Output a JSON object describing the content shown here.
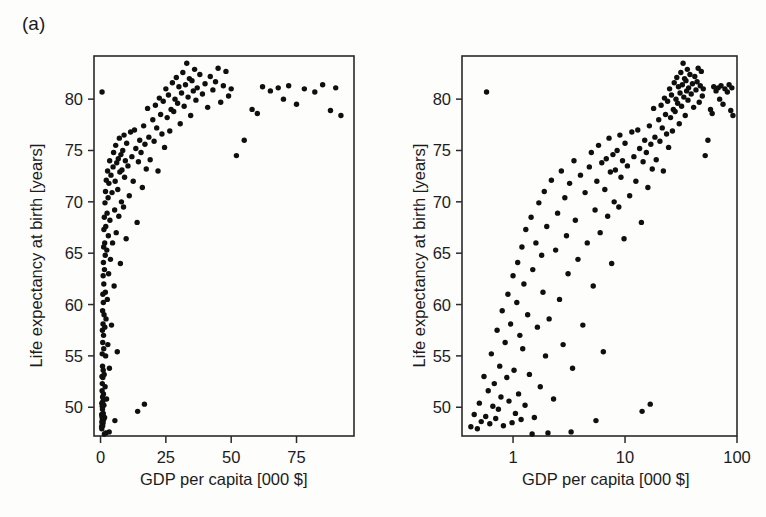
{
  "figure": {
    "panel_a_label": "(a)",
    "panel_b_label": "(b)",
    "y_axis_title": "Life expectancy at birth [years]",
    "x_axis_title": "GDP per capita [000 $]",
    "point_color": "#100f0f",
    "axis_color": "#2a2a2a",
    "background_color": "#fdfdfc"
  },
  "chart_data": [
    {
      "type": "scatter",
      "panel": "(a)",
      "title": "",
      "xlabel": "GDP per capita [000 $]",
      "ylabel": "Life expectancy at birth [years]",
      "xscale": "linear",
      "yscale": "linear",
      "xlim": [
        -2.5,
        97
      ],
      "ylim": [
        47.2,
        84.2
      ],
      "xticks": [
        0,
        25,
        50,
        75
      ],
      "xtick_labels": [
        "0",
        "25",
        "50",
        "75"
      ],
      "yticks": [
        50,
        55,
        60,
        65,
        70,
        75,
        80
      ],
      "ytick_labels": [
        "50",
        "55",
        "60",
        "65",
        "70",
        "75",
        "80"
      ],
      "grid": false,
      "legend": "none",
      "n_points": 181,
      "note": "Same data as panel (b); GDP on linear axis produces a sharply saturating curve."
    },
    {
      "type": "scatter",
      "panel": "(b)",
      "title": "",
      "xlabel": "GDP per capita [000 $]",
      "ylabel": "Life expectancy at birth [years]",
      "xscale": "log",
      "yscale": "linear",
      "xlim": [
        0.35,
        100
      ],
      "ylim": [
        47.2,
        84.2
      ],
      "xticks": [
        1,
        10,
        100
      ],
      "xtick_labels": [
        "1",
        "10",
        "100"
      ],
      "yticks": [
        50,
        55,
        60,
        65,
        70,
        75,
        80
      ],
      "ytick_labels": [
        "50",
        "55",
        "60",
        "65",
        "70",
        "75",
        "80"
      ],
      "grid": false,
      "legend": "none",
      "n_points": 181,
      "note": "Same data as panel (a); log GDP axis linearises the relationship."
    }
  ],
  "points": [
    [
      0.42,
      48.1
    ],
    [
      0.45,
      49.3
    ],
    [
      0.48,
      47.9
    ],
    [
      0.5,
      50.4
    ],
    [
      0.52,
      48.6
    ],
    [
      0.55,
      53.0
    ],
    [
      0.57,
      49.1
    ],
    [
      0.58,
      80.7
    ],
    [
      0.6,
      51.6
    ],
    [
      0.62,
      48.4
    ],
    [
      0.64,
      55.2
    ],
    [
      0.66,
      50.1
    ],
    [
      0.68,
      52.3
    ],
    [
      0.7,
      48.9
    ],
    [
      0.72,
      57.5
    ],
    [
      0.74,
      49.8
    ],
    [
      0.76,
      54.0
    ],
    [
      0.78,
      51.0
    ],
    [
      0.8,
      59.4
    ],
    [
      0.82,
      48.2
    ],
    [
      0.85,
      56.3
    ],
    [
      0.88,
      52.9
    ],
    [
      0.9,
      61.0
    ],
    [
      0.92,
      50.6
    ],
    [
      0.95,
      58.1
    ],
    [
      0.98,
      48.5
    ],
    [
      1.0,
      62.8
    ],
    [
      1.02,
      53.6
    ],
    [
      1.05,
      49.4
    ],
    [
      1.08,
      60.2
    ],
    [
      1.1,
      64.1
    ],
    [
      1.12,
      51.3
    ],
    [
      1.15,
      57.0
    ],
    [
      1.18,
      48.8
    ],
    [
      1.2,
      65.6
    ],
    [
      1.22,
      55.7
    ],
    [
      1.25,
      62.0
    ],
    [
      1.28,
      50.2
    ],
    [
      1.3,
      67.3
    ],
    [
      1.35,
      59.0
    ],
    [
      1.4,
      53.2
    ],
    [
      1.45,
      68.5
    ],
    [
      1.5,
      63.4
    ],
    [
      1.55,
      49.0
    ],
    [
      1.6,
      66.0
    ],
    [
      1.65,
      57.8
    ],
    [
      1.7,
      69.9
    ],
    [
      1.75,
      52.0
    ],
    [
      1.8,
      64.8
    ],
    [
      1.85,
      61.2
    ],
    [
      1.9,
      71.0
    ],
    [
      1.95,
      55.0
    ],
    [
      2.0,
      67.6
    ],
    [
      2.1,
      58.6
    ],
    [
      2.2,
      72.1
    ],
    [
      2.3,
      50.8
    ],
    [
      2.4,
      65.3
    ],
    [
      2.5,
      68.9
    ],
    [
      2.6,
      60.5
    ],
    [
      2.7,
      73.0
    ],
    [
      2.8,
      56.1
    ],
    [
      2.9,
      70.4
    ],
    [
      3.0,
      66.7
    ],
    [
      3.1,
      63.0
    ],
    [
      3.2,
      71.8
    ],
    [
      3.4,
      53.8
    ],
    [
      3.5,
      74.0
    ],
    [
      3.6,
      68.2
    ],
    [
      3.8,
      64.4
    ],
    [
      4.0,
      72.6
    ],
    [
      4.2,
      58.0
    ],
    [
      4.4,
      70.9
    ],
    [
      4.6,
      66.0
    ],
    [
      4.8,
      73.4
    ],
    [
      5.0,
      74.8
    ],
    [
      5.2,
      61.8
    ],
    [
      5.4,
      69.2
    ],
    [
      5.6,
      72.0
    ],
    [
      5.8,
      75.5
    ],
    [
      6.0,
      67.0
    ],
    [
      6.2,
      73.8
    ],
    [
      6.4,
      55.4
    ],
    [
      6.6,
      71.2
    ],
    [
      6.8,
      74.2
    ],
    [
      7.0,
      68.6
    ],
    [
      7.2,
      76.2
    ],
    [
      7.4,
      72.9
    ],
    [
      7.6,
      64.0
    ],
    [
      7.8,
      74.6
    ],
    [
      8.0,
      70.0
    ],
    [
      8.2,
      73.1
    ],
    [
      8.5,
      75.0
    ],
    [
      8.8,
      69.5
    ],
    [
      9.0,
      76.5
    ],
    [
      9.2,
      72.4
    ],
    [
      9.5,
      74.0
    ],
    [
      9.8,
      66.4
    ],
    [
      10.0,
      75.7
    ],
    [
      10.5,
      73.5
    ],
    [
      11.0,
      70.6
    ],
    [
      11.5,
      76.8
    ],
    [
      12.0,
      74.4
    ],
    [
      12.5,
      72.0
    ],
    [
      13.0,
      77.0
    ],
    [
      13.5,
      75.2
    ],
    [
      14.0,
      68.0
    ],
    [
      14.5,
      73.9
    ],
    [
      15.0,
      76.0
    ],
    [
      15.5,
      74.8
    ],
    [
      16.0,
      71.4
    ],
    [
      16.5,
      77.4
    ],
    [
      17.0,
      75.6
    ],
    [
      17.5,
      73.2
    ],
    [
      18.0,
      79.1
    ],
    [
      18.5,
      76.3
    ],
    [
      19.0,
      74.1
    ],
    [
      20.0,
      78.0
    ],
    [
      20.5,
      75.9
    ],
    [
      21.0,
      79.4
    ],
    [
      21.5,
      77.2
    ],
    [
      22.0,
      73.0
    ],
    [
      22.5,
      80.1
    ],
    [
      23.0,
      78.5
    ],
    [
      23.5,
      76.6
    ],
    [
      24.0,
      79.8
    ],
    [
      24.5,
      75.3
    ],
    [
      25.0,
      81.0
    ],
    [
      25.5,
      78.2
    ],
    [
      26.0,
      80.4
    ],
    [
      26.5,
      76.9
    ],
    [
      27.0,
      79.0
    ],
    [
      27.5,
      81.6
    ],
    [
      28.0,
      78.8
    ],
    [
      28.5,
      80.0
    ],
    [
      29.0,
      82.1
    ],
    [
      29.5,
      79.6
    ],
    [
      30.0,
      81.2
    ],
    [
      30.5,
      77.6
    ],
    [
      31.0,
      80.6
    ],
    [
      31.5,
      82.6
    ],
    [
      32.0,
      79.3
    ],
    [
      32.5,
      81.4
    ],
    [
      33.0,
      83.5
    ],
    [
      33.5,
      80.2
    ],
    [
      34.0,
      82.0
    ],
    [
      34.5,
      78.4
    ],
    [
      35.0,
      81.8
    ],
    [
      35.5,
      80.8
    ],
    [
      36.0,
      82.9
    ],
    [
      36.5,
      79.9
    ],
    [
      37.0,
      81.1
    ],
    [
      38.0,
      82.4
    ],
    [
      39.0,
      80.5
    ],
    [
      40.0,
      81.5
    ],
    [
      41.0,
      79.2
    ],
    [
      42.0,
      82.2
    ],
    [
      43.0,
      80.9
    ],
    [
      44.0,
      81.7
    ],
    [
      45.0,
      83.0
    ],
    [
      46.0,
      79.7
    ],
    [
      47.0,
      81.3
    ],
    [
      48.0,
      82.7
    ],
    [
      49.0,
      80.3
    ],
    [
      50.0,
      81.0
    ],
    [
      52.0,
      74.5
    ],
    [
      55.0,
      76.0
    ],
    [
      58.0,
      79.0
    ],
    [
      60.0,
      78.6
    ],
    [
      62.0,
      81.2
    ],
    [
      65.0,
      80.8
    ],
    [
      68.0,
      81.1
    ],
    [
      70.0,
      80.0
    ],
    [
      72.0,
      81.3
    ],
    [
      75.0,
      79.5
    ],
    [
      78.0,
      81.0
    ],
    [
      82.0,
      80.7
    ],
    [
      85.0,
      81.4
    ],
    [
      88.0,
      78.9
    ],
    [
      90.0,
      81.1
    ],
    [
      92.0,
      78.4
    ],
    [
      14.2,
      49.6
    ],
    [
      16.8,
      50.3
    ],
    [
      5.5,
      48.7
    ],
    [
      3.3,
      47.6
    ],
    [
      2.05,
      47.5
    ],
    [
      1.48,
      47.4
    ]
  ]
}
